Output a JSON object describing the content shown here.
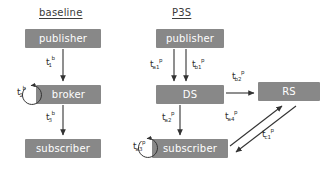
{
  "diagram": {
    "type": "flow-diagram",
    "panels": [
      {
        "id": "baseline",
        "title": "baseline",
        "nodes": [
          {
            "id": "publisher-baseline",
            "label": "publisher"
          },
          {
            "id": "broker-baseline",
            "label": "broker"
          },
          {
            "id": "subscriber-baseline",
            "label": "subscriber"
          }
        ],
        "edges": [
          {
            "from": "publisher",
            "to": "broker",
            "label": "t",
            "sub": "1",
            "sup": "b"
          },
          {
            "from": "broker",
            "to": "broker",
            "label": "t",
            "sub": "2",
            "sup": "b",
            "self_loop": true
          },
          {
            "from": "broker",
            "to": "subscriber",
            "label": "t",
            "sub": "3",
            "sup": "b"
          }
        ]
      },
      {
        "id": "p3s",
        "title": "P3S",
        "nodes": [
          {
            "id": "publisher-p3s",
            "label": "publisher"
          },
          {
            "id": "ds",
            "label": "DS"
          },
          {
            "id": "rs",
            "label": "RS"
          },
          {
            "id": "subscriber-p3s",
            "label": "subscriber"
          }
        ],
        "edges": [
          {
            "from": "publisher",
            "to": "ds",
            "label": "t",
            "sub": "a1",
            "sup": "p"
          },
          {
            "from": "publisher",
            "to": "ds",
            "label": "t",
            "sub": "b1",
            "sup": "p"
          },
          {
            "from": "ds",
            "to": "rs",
            "label": "t",
            "sub": "b2",
            "sup": "p"
          },
          {
            "from": "ds",
            "to": "subscriber",
            "label": "t",
            "sub": "a2",
            "sup": "p"
          },
          {
            "from": "subscriber",
            "to": "subscriber",
            "label": "t",
            "sub": "a3",
            "sup": "p",
            "self_loop": true
          },
          {
            "from": "subscriber",
            "to": "rs",
            "label": "t",
            "sub": "a4",
            "sup": "p"
          },
          {
            "from": "rs",
            "to": "subscriber",
            "label": "t",
            "sub": "c1",
            "sup": "p"
          }
        ]
      }
    ],
    "colors": {
      "node_fill": "#888888",
      "node_text": "#ffffff",
      "arrow": "#333333",
      "title_text": "#3a3a3a",
      "background": "#ffffff"
    }
  }
}
